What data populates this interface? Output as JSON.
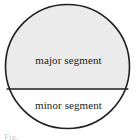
{
  "figure": {
    "type": "circle-segments-diagram",
    "caption": "Fig.",
    "geometry": {
      "circle_center_x": 67.5,
      "circle_center_y": 66.5,
      "circle_radius": 62.5,
      "chord_y": 89,
      "chord_x_start": 7,
      "chord_x_end": 128
    },
    "colors": {
      "outline": "#1f1f1f",
      "major_fill": "#ebebeb",
      "minor_fill": "#ffffff",
      "label_text": "#1a1a1a",
      "caption_text": "#c9c9c9",
      "background": "#ffffff"
    },
    "segments": [
      {
        "id": "major",
        "label": "major segment",
        "fill": "#ebebeb",
        "position": "above-chord"
      },
      {
        "id": "minor",
        "label": "minor segment",
        "fill": "#ffffff",
        "position": "below-chord"
      }
    ]
  }
}
